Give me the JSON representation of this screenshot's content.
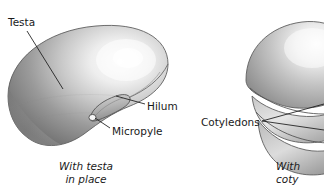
{
  "figure": {
    "background_color": "#ffffff",
    "text_color": "#1a1a1a",
    "labels": [
      {
        "id": "testa",
        "text": "Testa",
        "x": 8,
        "y": 16
      },
      {
        "id": "hilum",
        "text": "Hilum",
        "x": 147,
        "y": 100
      },
      {
        "id": "micropyle",
        "text": "Micropyle",
        "x": 112,
        "y": 125
      },
      {
        "id": "cotyledons",
        "text": "Cotyledons",
        "x": 201,
        "y": 116
      }
    ],
    "captions": [
      {
        "id": "left",
        "line1": "With testa",
        "line2": "in place"
      },
      {
        "id": "right",
        "line1": "With",
        "line2": "coty"
      }
    ],
    "seeds": [
      {
        "id": "seed-with-testa",
        "name": "bean-seed-with-testa",
        "parts": [
          "testa",
          "hilum",
          "micropyle"
        ],
        "shading": {
          "dark": "#7c7c7c",
          "mid": "#aeaeae",
          "light": "#f2f2f2"
        }
      },
      {
        "id": "seed-cotyledons-exposed",
        "name": "bean-seed-cotyledons-exposed",
        "parts": [
          "cotyledons"
        ],
        "shading": {
          "dark": "#8a8a8a",
          "mid": "#b8b8b8",
          "light": "#f4f4f4"
        }
      }
    ],
    "leader_lines": [
      {
        "id": "testa-leader",
        "from": [
          26,
          30
        ],
        "to": [
          62,
          88
        ]
      },
      {
        "id": "hilum-leader",
        "from": [
          144,
          105
        ],
        "to": [
          115,
          96
        ]
      },
      {
        "id": "micropyle-leader",
        "from": [
          110,
          129
        ],
        "to": [
          94,
          117
        ]
      },
      {
        "id": "cotyledons-leader-upper",
        "from": [
          262,
          121
        ],
        "to": [
          324,
          108
        ]
      },
      {
        "id": "cotyledons-leader-lower",
        "from": [
          262,
          121
        ],
        "to": [
          324,
          132
        ]
      }
    ]
  }
}
